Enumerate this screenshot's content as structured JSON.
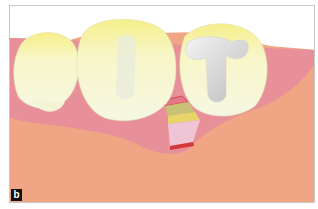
{
  "figure": {
    "panel_label": "b",
    "elements": [
      {
        "name": "left-tooth",
        "desc": "premolar crown"
      },
      {
        "name": "middle-tooth",
        "desc": "molar with root silhouette"
      },
      {
        "name": "right-tooth",
        "desc": "molar with metal T-shaped filling"
      },
      {
        "name": "gingiva",
        "desc": "pink gum tissue"
      },
      {
        "name": "bone",
        "desc": "salmon alveolar bone"
      },
      {
        "name": "graft-site",
        "desc": "layered defect/graft between teeth"
      }
    ],
    "colors": {
      "bone": "#f0a585",
      "gingiva": "#e8909a",
      "tooth": "#f7f7d0",
      "tooth_top": "#f4ee8a",
      "filling": "#e6e6e6",
      "graft_pink": "#efc5d6",
      "graft_yellow": "#e8d56a",
      "graft_olive": "#c9c274",
      "graft_red": "#d23a3a",
      "label_bg": "#111111"
    }
  }
}
